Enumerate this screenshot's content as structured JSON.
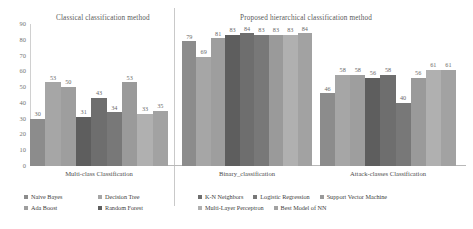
{
  "panels": {
    "left_title": "Classical classification method",
    "right_title": "Proposed hierarchical classification method"
  },
  "chart_data": {
    "type": "bar",
    "xlabel": "",
    "ylabel": "",
    "ylim": [
      0,
      90
    ],
    "grid": false,
    "legend_position": "bottom",
    "yticks": [
      90,
      80,
      70,
      60,
      50,
      40,
      30,
      20,
      10,
      0
    ],
    "categories": [
      "Multi-class Classification",
      "Binary_classification",
      "Attack-classes Classification"
    ],
    "series": [
      {
        "name": "Naive Bayes",
        "color": "#8c8c8c",
        "values": [
          30,
          79,
          46
        ]
      },
      {
        "name": "Decision Tree",
        "color": "#a6a6a6",
        "values": [
          53,
          69,
          58
        ]
      },
      {
        "name": "Ada Boost",
        "color": "#9e9e9e",
        "values": [
          50,
          81,
          58
        ]
      },
      {
        "name": "Random Forest",
        "color": "#5e5e5e",
        "values": [
          31,
          83,
          56
        ]
      },
      {
        "name": "K-N Neighbors",
        "color": "#6e6e6e",
        "values": [
          43,
          84,
          58
        ]
      },
      {
        "name": "Logistic Regression",
        "color": "#787878",
        "values": [
          34,
          83,
          40
        ]
      },
      {
        "name": "Support Vector Machine",
        "color": "#9a9a9a",
        "values": [
          53,
          83,
          56
        ]
      },
      {
        "name": "Multi-Layer Perceptron",
        "color": "#b0b0b0",
        "values": [
          33,
          83,
          61
        ]
      },
      {
        "name": "Best Model of NN",
        "color": "#a2a2a2",
        "values": [
          35,
          84,
          61
        ]
      }
    ],
    "bar_labels": {
      "group0": [
        "30",
        "53",
        "50",
        "31",
        "43",
        "34",
        "53",
        "33",
        "35"
      ],
      "group1": [
        "79",
        "69",
        "81",
        "83",
        "84",
        "83",
        "83",
        "83",
        "84"
      ],
      "group2": [
        "46",
        "58",
        "58",
        "56",
        "58",
        "40",
        "56",
        "61",
        "61"
      ]
    }
  },
  "legend": {
    "left": [
      {
        "label": "Naive Bayes",
        "color": "#8c8c8c"
      },
      {
        "label": "Decision Tree",
        "color": "#a6a6a6"
      },
      {
        "label": "Ada Boost",
        "color": "#9e9e9e"
      },
      {
        "label": "Random Forest",
        "color": "#5e5e5e"
      }
    ],
    "right": [
      {
        "label": "K-N Neighbors",
        "color": "#6e6e6e"
      },
      {
        "label": "Logistic Regression",
        "color": "#787878"
      },
      {
        "label": "Support Vector Machine",
        "color": "#9a9a9a"
      },
      {
        "label": "Multi-Layer Perceptron",
        "color": "#b0b0b0"
      },
      {
        "label": "Best Model of NN",
        "color": "#a2a2a2"
      }
    ]
  }
}
